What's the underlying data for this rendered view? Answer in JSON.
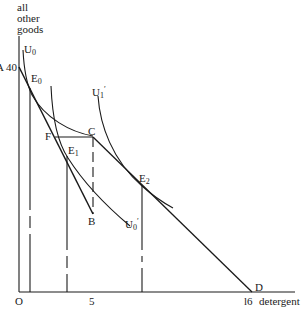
{
  "diagram": {
    "y_axis_label": [
      "all",
      "other",
      "goods"
    ],
    "x_axis_label": "detergent",
    "origin_label": "O",
    "y_tick": {
      "prefix": "A",
      "value": "40"
    },
    "x_ticks": [
      "5",
      "l6"
    ],
    "points": {
      "E0": {
        "base": "E",
        "sub": "0"
      },
      "E1": {
        "base": "E",
        "sub": "1"
      },
      "E2": {
        "base": "E",
        "sub": "2"
      },
      "F": "F",
      "C": "C",
      "B": "B",
      "D": "D"
    },
    "curves": {
      "U0": {
        "base": "U",
        "sub": "0"
      },
      "U0p": {
        "base": "U",
        "sub": "0",
        "prime": "′"
      },
      "U1p": {
        "base": "U",
        "sub": "1",
        "prime": "′"
      }
    },
    "line_color": "#1a1a1a"
  }
}
